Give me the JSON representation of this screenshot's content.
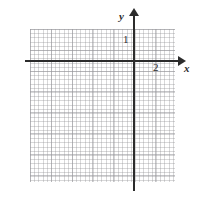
{
  "figure": {
    "title": "",
    "background_color": "#ffffff",
    "width": 200,
    "height": 197
  },
  "axes": {
    "x_axis_label": "x",
    "y_axis_label": "y",
    "axis_color": "#2c2c2c",
    "x_axis_arrow": "arrow-right",
    "y_axis_arrow": "arrow-up"
  },
  "tick_labels": {
    "x_tick_2": "2",
    "y_tick_1": "1"
  },
  "grid": {
    "major_color": "#96969b",
    "minor_color": "#78787d",
    "major_spacing_px": 20.8,
    "minor_spacing_px": 4.2
  },
  "chart_data": {
    "type": "scatter",
    "title": "",
    "subtitle": "",
    "xlabel": "x",
    "ylabel": "y",
    "grid": true,
    "minor_grid": true,
    "legend": null,
    "legend_position": "none",
    "xlim": [
      -5,
      2.5
    ],
    "ylim": [
      -6,
      6.5
    ],
    "xticks": [
      2
    ],
    "xtick_labels": [
      "2"
    ],
    "yticks": [
      1
    ],
    "ytick_labels": [
      "1"
    ],
    "series": [],
    "annotations": []
  }
}
